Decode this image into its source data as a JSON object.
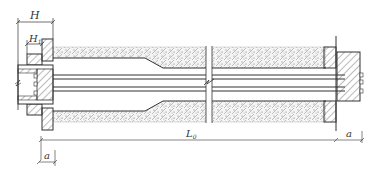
{
  "diagram": {
    "type": "anchor-cross-section",
    "colors": {
      "line": "#333333",
      "hatch": "#555555",
      "concrete_fill": "#f2f2f2",
      "background": "#ffffff"
    },
    "labels": {
      "H": "H",
      "H1": "H",
      "H1_sub": "1",
      "L0": "L",
      "L0_sub": "0",
      "a_left": "a",
      "a_right": "a"
    },
    "parts": [
      "left-anchor-plate",
      "left-bearing-plate",
      "left-coupler",
      "concrete-body",
      "duct",
      "tendons",
      "break-mark",
      "right-bearing-plate",
      "right-anchor-block",
      "dimension-H",
      "dimension-H1",
      "dimension-L0",
      "dimension-a-left",
      "dimension-a-right"
    ]
  }
}
